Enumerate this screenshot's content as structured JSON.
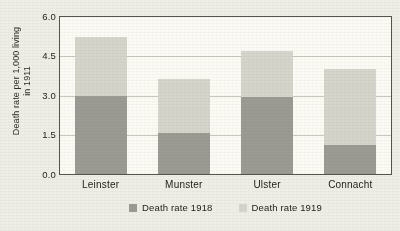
{
  "chart_data": {
    "type": "bar",
    "subtype": "stacked-bar",
    "title": "",
    "xlabel": "",
    "ylabel": "Death rate per 1,000 living in 1911",
    "categories": [
      "Leinster",
      "Munster",
      "Ulster",
      "Connacht"
    ],
    "series": [
      {
        "name": "Death rate 1918",
        "color": "#9c9b93",
        "values": [
          3.0,
          1.55,
          2.95,
          1.1
        ]
      },
      {
        "name": "Death rate 1919",
        "color": "#d6d5cb",
        "values": [
          2.25,
          2.1,
          1.75,
          2.9
        ]
      }
    ],
    "totals": [
      5.25,
      3.65,
      4.7,
      4.0
    ],
    "ylim": [
      0.0,
      6.0
    ],
    "yticks": [
      "6.0",
      "4.5",
      "3.0",
      "1.5",
      "0.0"
    ],
    "ytick_values": [
      6.0,
      4.5,
      3.0,
      1.5,
      0.0
    ],
    "grid": true,
    "grid_axis": "y",
    "legend_position": "bottom",
    "plot_background": "#fbfaf4",
    "page_background": "#efeee6",
    "frame_color": "#55534c"
  },
  "axis": {
    "ylabel_line1": "Death rate per 1,000 living",
    "ylabel_line2": "in 1911",
    "tick_0": "6.0",
    "tick_1": "4.5",
    "tick_2": "3.0",
    "tick_3": "1.5",
    "tick_4": "0.0"
  },
  "categories": {
    "c0": "Leinster",
    "c1": "Munster",
    "c2": "Ulster",
    "c3": "Connacht"
  },
  "legend": {
    "item0": "Death rate 1918",
    "item1": "Death rate 1919"
  }
}
